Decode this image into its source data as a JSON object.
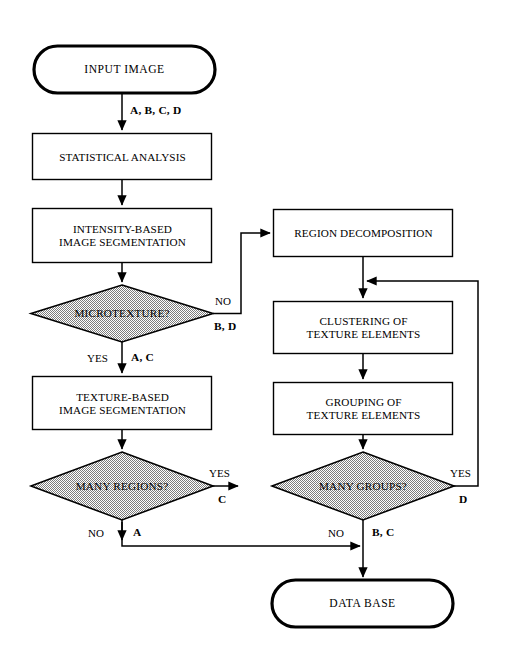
{
  "diagram": {
    "colors": {
      "stroke": "#000000",
      "decision_fill": "#c0c0c0",
      "background": "#ffffff",
      "text": "#000000"
    },
    "nodes": [
      {
        "id": "input_image",
        "type": "terminal",
        "label": "INPUT IMAGE"
      },
      {
        "id": "statistical_analysis",
        "type": "process",
        "label": "STATISTICAL ANALYSIS"
      },
      {
        "id": "intensity_segmentation",
        "type": "process",
        "label": "INTENSITY-BASED\nIMAGE SEGMENTATION"
      },
      {
        "id": "microtexture",
        "type": "decision",
        "label": "MICROTEXTURE?"
      },
      {
        "id": "texture_segmentation",
        "type": "process",
        "label": "TEXTURE-BASED\nIMAGE SEGMENTATION"
      },
      {
        "id": "many_regions",
        "type": "decision",
        "label": "MANY REGIONS?"
      },
      {
        "id": "region_decomposition",
        "type": "process",
        "label": "REGION DECOMPOSITION"
      },
      {
        "id": "clustering",
        "type": "process",
        "label": "CLUSTERING OF\nTEXTURE ELEMENTS"
      },
      {
        "id": "grouping",
        "type": "process",
        "label": "GROUPING OF\nTEXTURE ELEMENTS"
      },
      {
        "id": "many_groups",
        "type": "decision",
        "label": "MANY GROUPS?"
      },
      {
        "id": "data_base",
        "type": "terminal",
        "label": "DATA BASE"
      }
    ],
    "edges": [
      {
        "id": "input-to-statistical",
        "from": "input_image",
        "to": "statistical_analysis",
        "condition": "",
        "tokens": "A, B, C, D"
      },
      {
        "id": "statistical-to-intensity",
        "from": "statistical_analysis",
        "to": "intensity_segmentation",
        "condition": "",
        "tokens": ""
      },
      {
        "id": "intensity-to-microtexture",
        "from": "intensity_segmentation",
        "to": "microtexture",
        "condition": "",
        "tokens": ""
      },
      {
        "id": "microtexture-no",
        "from": "microtexture",
        "to": "region_decomposition",
        "condition": "NO",
        "tokens": "B, D"
      },
      {
        "id": "microtexture-yes",
        "from": "microtexture",
        "to": "texture_segmentation",
        "condition": "YES",
        "tokens": "A, C"
      },
      {
        "id": "texture-to-manyregions",
        "from": "texture_segmentation",
        "to": "many_regions",
        "condition": "",
        "tokens": ""
      },
      {
        "id": "manyregions-yes",
        "from": "many_regions",
        "to": "region_decomposition",
        "condition": "YES",
        "tokens": "C"
      },
      {
        "id": "manyregions-no",
        "from": "many_regions",
        "to": "data_base",
        "condition": "NO",
        "tokens": "A"
      },
      {
        "id": "region-to-clustering",
        "from": "region_decomposition",
        "to": "clustering",
        "condition": "",
        "tokens": ""
      },
      {
        "id": "clustering-to-grouping",
        "from": "clustering",
        "to": "grouping",
        "condition": "",
        "tokens": ""
      },
      {
        "id": "grouping-to-manygroups",
        "from": "grouping",
        "to": "many_groups",
        "condition": "",
        "tokens": ""
      },
      {
        "id": "manygroups-yes",
        "from": "many_groups",
        "to": "clustering",
        "condition": "YES",
        "tokens": "D"
      },
      {
        "id": "manygroups-no",
        "from": "many_groups",
        "to": "data_base",
        "condition": "NO",
        "tokens": "B, C"
      }
    ],
    "edge_labels": {
      "input_tokens": "A, B, C, D",
      "microtexture_no": "NO",
      "microtexture_no_tokens": "B, D",
      "microtexture_yes": "YES",
      "microtexture_yes_tokens": "A, C",
      "many_regions_yes": "YES",
      "many_regions_yes_tokens": "C",
      "many_regions_no": "NO",
      "many_regions_no_tokens": "A",
      "many_groups_yes": "YES",
      "many_groups_yes_tokens": "D",
      "many_groups_no": "NO",
      "many_groups_no_tokens": "B, C"
    }
  }
}
